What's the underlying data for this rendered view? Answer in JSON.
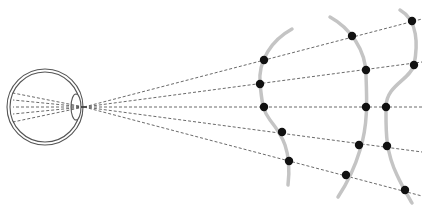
{
  "diagram": {
    "colors": {
      "background": "#ffffff",
      "eye_outline": "#555555",
      "rays": "#444444",
      "surfaces": "#c4c4c4",
      "points": "#111111"
    },
    "eye": {
      "center": [
        45,
        107
      ],
      "outer_radius": 38,
      "inner_radius": 35,
      "lens": {
        "center": [
          76,
          107
        ],
        "rx": 5,
        "ry": 13
      },
      "focal_point": [
        84,
        107
      ],
      "internal_rays_end_y": [
        93,
        100,
        107,
        114,
        122
      ]
    },
    "rays": [
      {
        "end": [
          422,
          19
        ]
      },
      {
        "end": [
          422,
          62
        ]
      },
      {
        "end": [
          422,
          107
        ]
      },
      {
        "end": [
          422,
          152
        ]
      },
      {
        "end": [
          422,
          196
        ]
      }
    ],
    "surfaces": [
      {
        "name": "surface-1",
        "path": "M 292 29 C 272 40, 258 60, 260 84 C 262 100, 262 110, 270 120 C 282 135, 292 150, 288 185",
        "points": [
          [
            264,
            60
          ],
          [
            260,
            84
          ],
          [
            264,
            107
          ],
          [
            282,
            132
          ],
          [
            289,
            161
          ]
        ]
      },
      {
        "name": "surface-2",
        "path": "M 330 17 C 350 28, 366 50, 366 75 C 367 100, 368 125, 360 150 C 354 170, 346 185, 338 197",
        "points": [
          [
            352,
            36
          ],
          [
            366,
            70
          ],
          [
            366,
            107
          ],
          [
            359,
            145
          ],
          [
            346,
            175
          ]
        ]
      },
      {
        "name": "surface-3",
        "path": "M 400 10 C 418 20, 418 45, 414 65 C 410 80, 386 85, 386 107 C 386 130, 385 150, 397 175 C 402 186, 408 196, 412 203",
        "points": [
          [
            412,
            21
          ],
          [
            414,
            65
          ],
          [
            386,
            107
          ],
          [
            387,
            146
          ],
          [
            405,
            190
          ]
        ]
      }
    ]
  }
}
